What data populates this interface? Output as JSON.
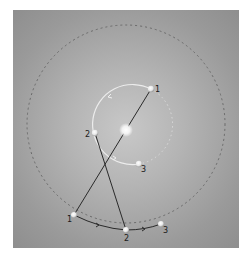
{
  "diagram": {
    "background_color": "#a8a8a8",
    "outer_orbit": {
      "style": "dashed",
      "color": "#6a6a6a"
    },
    "inner_orbit": {
      "style": "solid-then-dotted",
      "color": "#e6e6e6"
    },
    "center_body": {
      "label": ""
    },
    "inner_points": [
      {
        "label": "1"
      },
      {
        "label": "2"
      },
      {
        "label": "3"
      }
    ],
    "outer_points": [
      {
        "label": "1"
      },
      {
        "label": "2"
      },
      {
        "label": "3"
      }
    ],
    "line_color": "#2a2a2a"
  }
}
